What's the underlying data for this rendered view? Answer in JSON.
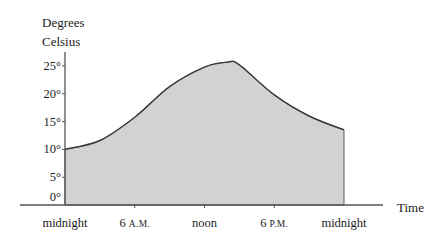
{
  "chart_data": {
    "type": "area",
    "title_lines": [
      "Degrees",
      "Celsius"
    ],
    "xlabel": "Time",
    "ylabel": "Degrees Celsius",
    "x_unit": "hours since midnight",
    "xlim": [
      0,
      24
    ],
    "ylim": [
      0,
      27
    ],
    "y_ticks": [
      {
        "value": 0,
        "label": "0°"
      },
      {
        "value": 5,
        "label": "5°"
      },
      {
        "value": 10,
        "label": "10°"
      },
      {
        "value": 15,
        "label": "15°"
      },
      {
        "value": 20,
        "label": "20°"
      },
      {
        "value": 25,
        "label": "25°"
      }
    ],
    "x_ticks": [
      {
        "value": 0,
        "label": "midnight",
        "suffix": ""
      },
      {
        "value": 6,
        "label": "6 ",
        "suffix": "A.M."
      },
      {
        "value": 12,
        "label": "noon",
        "suffix": ""
      },
      {
        "value": 18,
        "label": "6 ",
        "suffix": "P.M."
      },
      {
        "value": 24,
        "label": "midnight",
        "suffix": ""
      }
    ],
    "series": [
      {
        "name": "Temperature",
        "x": [
          0,
          3,
          6,
          9,
          12,
          14,
          15,
          18,
          21,
          24
        ],
        "values": [
          10,
          11.6,
          15.8,
          21.3,
          24.8,
          25.7,
          25.2,
          19.8,
          16,
          13.5
        ]
      }
    ],
    "grid": false,
    "legend": "none",
    "colors": {
      "fill": "#d2d2d2",
      "stroke": "#3a3a3a",
      "axis": "#555555"
    }
  }
}
